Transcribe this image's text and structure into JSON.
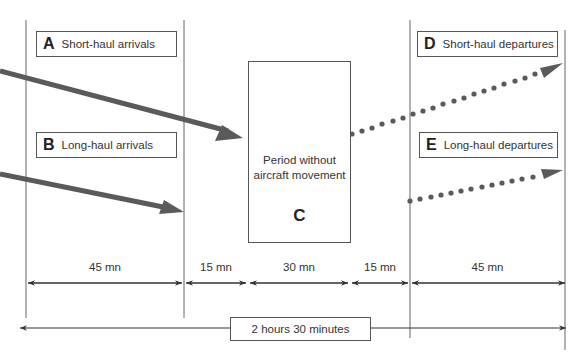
{
  "diagram": {
    "colors": {
      "arrow": "#5a5a5a",
      "line": "#555555",
      "text": "#333333"
    },
    "boxes": {
      "A": {
        "letter": "A",
        "label": "Short-haul arrivals"
      },
      "B": {
        "letter": "B",
        "label": "Long-haul arrivals"
      },
      "C": {
        "letter": "C",
        "label_line1": "Period without",
        "label_line2": "aircraft movement"
      },
      "D": {
        "letter": "D",
        "label": "Short-haul departures"
      },
      "E": {
        "letter": "E",
        "label": "Long-haul departures"
      }
    },
    "durations": [
      "45 mn",
      "15 mn",
      "30 mn",
      "15 mn",
      "45 mn"
    ],
    "total": "2 hours 30 minutes"
  }
}
